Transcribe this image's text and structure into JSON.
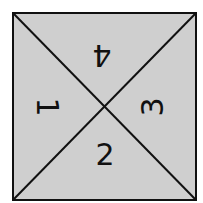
{
  "diagram": {
    "shape": "square divided by two diagonals into four triangles",
    "fill_color": "#cfcfcf",
    "line_color": "#111111",
    "triangles": [
      {
        "position": "top",
        "label": "4",
        "rotation_deg": 180
      },
      {
        "position": "left",
        "label": "1",
        "rotation_deg": 90
      },
      {
        "position": "right",
        "label": "3",
        "rotation_deg": -90
      },
      {
        "position": "bottom",
        "label": "2",
        "rotation_deg": 0
      }
    ]
  }
}
